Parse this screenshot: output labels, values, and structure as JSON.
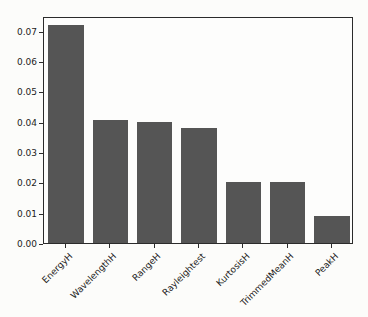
{
  "figure": {
    "width_px": 368,
    "height_px": 317
  },
  "colors": {
    "bar": "#555555",
    "axis": "#2b2b2b",
    "tick_text": "#1c1c1c",
    "background": "#fcfcfa",
    "plot_background": "#fdfdfc"
  },
  "chart_data": {
    "type": "bar",
    "categories": [
      "EnergyH",
      "WavelengthH",
      "RangeH",
      "Rayleightest",
      "KurtosisH",
      "TrimmedMeanH",
      "PeakH"
    ],
    "values": [
      0.0717,
      0.0405,
      0.04,
      0.038,
      0.02,
      0.02,
      0.009
    ],
    "title": "",
    "xlabel": "",
    "ylabel": "",
    "ylim": [
      0,
      0.0748
    ],
    "yticks": [
      0,
      0.01,
      0.02,
      0.03,
      0.04,
      0.05,
      0.06,
      0.07
    ],
    "ytick_format_decimals": 2,
    "xtick_rotation_deg": 45,
    "bar_width_fraction": 0.8,
    "grid": false,
    "legend": false
  }
}
